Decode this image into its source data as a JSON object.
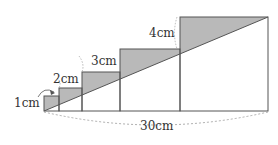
{
  "diagram": {
    "type": "staircase-rectangles",
    "colors": {
      "fill": "#b9b9b9",
      "stroke": "#555555",
      "dashed": "#9a9a9a",
      "text": "#333333"
    },
    "labels": {
      "step1": "1cm",
      "step2": "2cm",
      "step3": "3cm",
      "step4": "4cm",
      "total_width": "30cm"
    },
    "rectangles": [
      {
        "index": 1,
        "side_label": "1cm"
      },
      {
        "index": 2,
        "side_label": "2cm"
      },
      {
        "index": 3,
        "side_label": "3cm"
      },
      {
        "index": 4,
        "side_label": "4cm"
      },
      {
        "index": 5,
        "side_label": ""
      }
    ]
  }
}
